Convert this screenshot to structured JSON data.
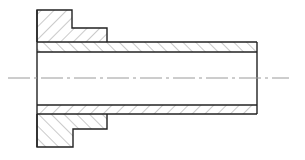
{
  "drawing": {
    "title": "Flanged sleeve section view",
    "colors": {
      "background": "#ffffff",
      "outline": "#222222",
      "hatch": "#8a8a8a",
      "centerline": "#9a9a9a"
    },
    "geometry": {
      "outer_left_x": 37,
      "flange_top_y": 10,
      "flange_step_x": 72,
      "flange_step_y": 28,
      "hub_right_x": 107,
      "tube_outer_top_y": 42,
      "tube_inner_top_y": 52,
      "tube_inner_bottom_y": 105,
      "tube_outer_bottom_y": 114,
      "flange_bottom_step_y": 129,
      "flange_bottom_y": 147,
      "tube_right_x": 257,
      "centerline_y": 78,
      "centerline_x1": 8,
      "centerline_x2": 289
    }
  }
}
